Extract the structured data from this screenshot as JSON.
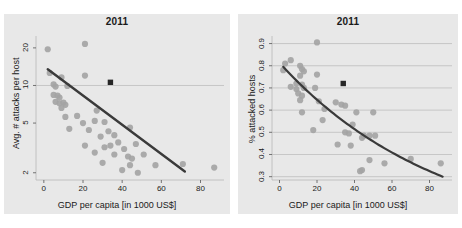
{
  "figure": {
    "background_color": "#ffffff",
    "panel_background_color": "#e8e8e8",
    "point_color": "#a3a3a3",
    "line_color": "#3a3a3a",
    "marker_color": "#262626",
    "grid_color": "#b8b8b8"
  },
  "chart_data": [
    {
      "type": "scatter",
      "id": "left-panel",
      "title": "2011",
      "xlabel": "GDP per capita [in 1000 US$]",
      "ylabel": "Avg. # attacks per host",
      "xlim": [
        -4,
        92
      ],
      "ylim": [
        1.75,
        24
      ],
      "yscale": "log",
      "xticks": [
        0,
        20,
        40,
        60,
        80
      ],
      "xticklabels": [
        "0",
        "20",
        "40",
        "60",
        "80"
      ],
      "yticks": [
        2,
        5,
        10,
        20
      ],
      "yticklabels": [
        "2",
        "5",
        "10",
        "20"
      ],
      "grid": "horizontal-at-10-only",
      "gridlines_y": [
        10
      ],
      "points": [
        {
          "x": 2,
          "y": 19.5
        },
        {
          "x": 21,
          "y": 21.5
        },
        {
          "x": 3,
          "y": 12.6
        },
        {
          "x": 9,
          "y": 11.6
        },
        {
          "x": 21,
          "y": 12.0
        },
        {
          "x": 5,
          "y": 10.2
        },
        {
          "x": 6,
          "y": 9.8
        },
        {
          "x": 12,
          "y": 9.9
        },
        {
          "x": 5,
          "y": 8.4
        },
        {
          "x": 7,
          "y": 8.3
        },
        {
          "x": 8,
          "y": 8.0
        },
        {
          "x": 6,
          "y": 7.4
        },
        {
          "x": 8,
          "y": 7.2
        },
        {
          "x": 10,
          "y": 7.3
        },
        {
          "x": 11,
          "y": 7.0
        },
        {
          "x": 9,
          "y": 6.6
        },
        {
          "x": 11,
          "y": 5.6
        },
        {
          "x": 17,
          "y": 5.7
        },
        {
          "x": 27,
          "y": 6.3
        },
        {
          "x": 20,
          "y": 5.0
        },
        {
          "x": 26,
          "y": 5.2
        },
        {
          "x": 31,
          "y": 5.1
        },
        {
          "x": 13,
          "y": 4.5
        },
        {
          "x": 23,
          "y": 4.4
        },
        {
          "x": 33,
          "y": 4.3
        },
        {
          "x": 29,
          "y": 3.9
        },
        {
          "x": 36,
          "y": 4.0
        },
        {
          "x": 44,
          "y": 4.6
        },
        {
          "x": 21,
          "y": 3.3
        },
        {
          "x": 31,
          "y": 3.2
        },
        {
          "x": 34,
          "y": 3.3
        },
        {
          "x": 38,
          "y": 3.5
        },
        {
          "x": 41,
          "y": 3.1
        },
        {
          "x": 47,
          "y": 3.4
        },
        {
          "x": 26,
          "y": 2.9
        },
        {
          "x": 36,
          "y": 2.8
        },
        {
          "x": 43,
          "y": 2.7
        },
        {
          "x": 45,
          "y": 2.6
        },
        {
          "x": 51,
          "y": 2.8
        },
        {
          "x": 30,
          "y": 2.4
        },
        {
          "x": 44,
          "y": 2.3
        },
        {
          "x": 57,
          "y": 2.3
        },
        {
          "x": 71,
          "y": 2.35
        },
        {
          "x": 87,
          "y": 2.2
        },
        {
          "x": 40,
          "y": 2.1
        },
        {
          "x": 48,
          "y": 2.0
        }
      ],
      "highlight_marker": {
        "x": 34,
        "y": 10.6,
        "shape": "square",
        "color": "#262626"
      },
      "trend": {
        "kind": "line-on-log-y",
        "from": {
          "x": 2,
          "y": 13.5
        },
        "to": {
          "x": 72,
          "y": 2.05
        }
      }
    },
    {
      "type": "scatter",
      "id": "right-panel",
      "title": "2011",
      "xlabel": "GDP per capita [in 1000 US$]",
      "ylabel": "% attacked hosts",
      "xlim": [
        -4,
        92
      ],
      "ylim": [
        0.285,
        0.925
      ],
      "yscale": "linear",
      "xticks": [
        0,
        20,
        40,
        60,
        80
      ],
      "xticklabels": [
        "0",
        "20",
        "40",
        "60",
        "80"
      ],
      "yticks": [
        0.3,
        0.4,
        0.5,
        0.6,
        0.7,
        0.8,
        0.9
      ],
      "yticklabels": [
        "0.3",
        "0.4",
        "0.5",
        "0.6",
        "0.7",
        "0.8",
        "0.9"
      ],
      "grid": "horizontal",
      "gridlines_y": [
        0.3,
        0.4,
        0.5,
        0.6,
        0.7,
        0.8,
        0.9
      ],
      "points": [
        {
          "x": 20,
          "y": 0.905
        },
        {
          "x": 3,
          "y": 0.81
        },
        {
          "x": 6,
          "y": 0.825
        },
        {
          "x": 11,
          "y": 0.8
        },
        {
          "x": 2,
          "y": 0.78
        },
        {
          "x": 12,
          "y": 0.785
        },
        {
          "x": 13,
          "y": 0.775
        },
        {
          "x": 11,
          "y": 0.755
        },
        {
          "x": 20,
          "y": 0.76
        },
        {
          "x": 6,
          "y": 0.705
        },
        {
          "x": 9,
          "y": 0.72
        },
        {
          "x": 12,
          "y": 0.715
        },
        {
          "x": 9,
          "y": 0.695
        },
        {
          "x": 13,
          "y": 0.7
        },
        {
          "x": 19,
          "y": 0.7
        },
        {
          "x": 10,
          "y": 0.675
        },
        {
          "x": 12,
          "y": 0.665
        },
        {
          "x": 11,
          "y": 0.645
        },
        {
          "x": 21,
          "y": 0.64
        },
        {
          "x": 30,
          "y": 0.635
        },
        {
          "x": 33,
          "y": 0.625
        },
        {
          "x": 35,
          "y": 0.62
        },
        {
          "x": 24,
          "y": 0.605
        },
        {
          "x": 12,
          "y": 0.59
        },
        {
          "x": 41,
          "y": 0.59
        },
        {
          "x": 50,
          "y": 0.59
        },
        {
          "x": 23,
          "y": 0.555
        },
        {
          "x": 39,
          "y": 0.535
        },
        {
          "x": 18,
          "y": 0.51
        },
        {
          "x": 35,
          "y": 0.5
        },
        {
          "x": 37,
          "y": 0.495
        },
        {
          "x": 45,
          "y": 0.485
        },
        {
          "x": 48,
          "y": 0.485
        },
        {
          "x": 51,
          "y": 0.485
        },
        {
          "x": 44,
          "y": 0.475
        },
        {
          "x": 31,
          "y": 0.445
        },
        {
          "x": 38,
          "y": 0.44
        },
        {
          "x": 48,
          "y": 0.375
        },
        {
          "x": 70,
          "y": 0.38
        },
        {
          "x": 56,
          "y": 0.36
        },
        {
          "x": 86,
          "y": 0.36
        },
        {
          "x": 44,
          "y": 0.33
        },
        {
          "x": 43,
          "y": 0.325
        }
      ],
      "highlight_marker": {
        "x": 34,
        "y": 0.72,
        "shape": "square",
        "color": "#262626"
      },
      "trend": {
        "kind": "exponential-decay",
        "from": {
          "x": 2,
          "y": 0.795
        },
        "to": {
          "x": 87,
          "y": 0.3
        }
      }
    }
  ]
}
